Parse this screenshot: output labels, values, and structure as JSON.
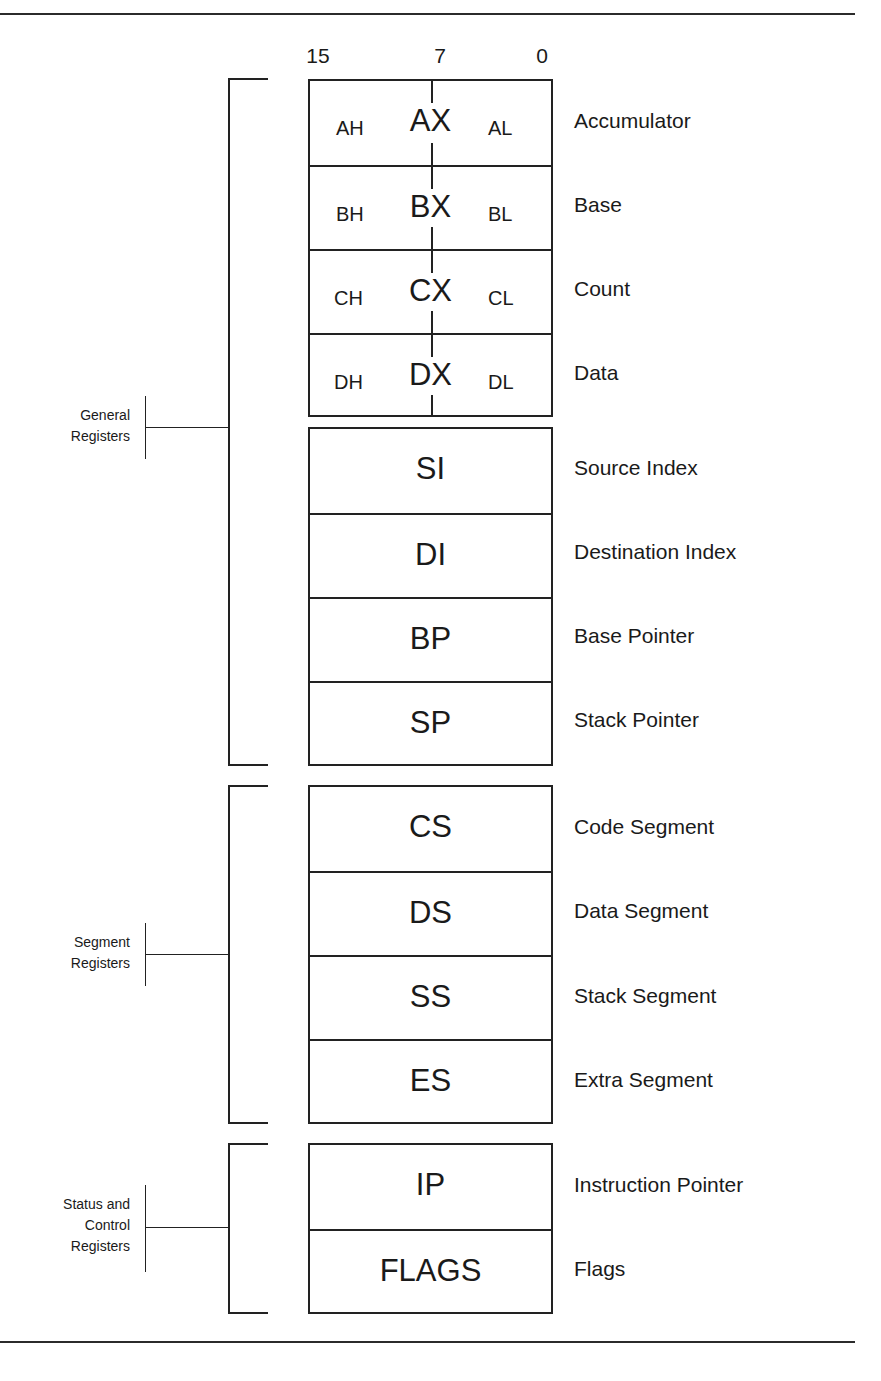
{
  "bits": {
    "high": "15",
    "mid": "7",
    "low": "0"
  },
  "general_registers": {
    "group_label_line1": "General",
    "group_label_line2": "Registers",
    "split": [
      {
        "name": "AX",
        "high": "AH",
        "low": "AL",
        "description": "Accumulator"
      },
      {
        "name": "BX",
        "high": "BH",
        "low": "BL",
        "description": "Base"
      },
      {
        "name": "CX",
        "high": "CH",
        "low": "CL",
        "description": "Count"
      },
      {
        "name": "DX",
        "high": "DH",
        "low": "DL",
        "description": "Data"
      }
    ],
    "index": [
      {
        "name": "SI",
        "description": "Source Index"
      },
      {
        "name": "DI",
        "description": "Destination Index"
      },
      {
        "name": "BP",
        "description": "Base Pointer"
      },
      {
        "name": "SP",
        "description": "Stack Pointer"
      }
    ]
  },
  "segment_registers": {
    "group_label_line1": "Segment",
    "group_label_line2": "Registers",
    "items": [
      {
        "name": "CS",
        "description": "Code Segment"
      },
      {
        "name": "DS",
        "description": "Data Segment"
      },
      {
        "name": "SS",
        "description": "Stack Segment"
      },
      {
        "name": "ES",
        "description": "Extra Segment"
      }
    ]
  },
  "status_control_registers": {
    "group_label_line1": "Status and",
    "group_label_line2": "Control",
    "group_label_line3": "Registers",
    "items": [
      {
        "name": "IP",
        "description": "Instruction Pointer"
      },
      {
        "name": "FLAGS",
        "description": "Flags"
      }
    ]
  }
}
